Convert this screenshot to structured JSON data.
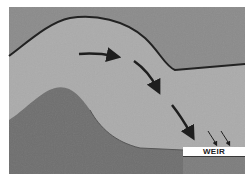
{
  "figure": {
    "labels": {
      "weir": "WEIR"
    },
    "colors": {
      "background": "#ffffff",
      "upper_field": "#8a8a8a",
      "water_body": "#a9a9a9",
      "mound": "#6e6e6e",
      "lower_right": "#7c7c7c",
      "outline": "#222222",
      "arrow": "#1e1e1e",
      "label_bg": "#ffffff"
    },
    "arrows": [
      {
        "name": "arrow-1",
        "direction": "right"
      },
      {
        "name": "arrow-2",
        "direction": "down-right"
      },
      {
        "name": "arrow-3",
        "direction": "down-right"
      },
      {
        "name": "arrow-small-1",
        "direction": "down"
      },
      {
        "name": "arrow-small-2",
        "direction": "down"
      }
    ]
  }
}
